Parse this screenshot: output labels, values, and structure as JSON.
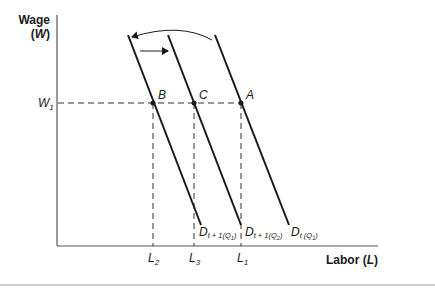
{
  "diagram": {
    "y_axis": {
      "label_line1": "Wage",
      "label_line2": "(W)"
    },
    "x_axis": {
      "label": "Labor (L)"
    },
    "wage_level": {
      "label": "W",
      "subscript": "1"
    },
    "points": [
      {
        "id": "B",
        "label": "B"
      },
      {
        "id": "C",
        "label": "C"
      },
      {
        "id": "A",
        "label": "A"
      }
    ],
    "labor_ticks": [
      {
        "label": "L",
        "subscript": "2"
      },
      {
        "label": "L",
        "subscript": "3"
      },
      {
        "label": "L",
        "subscript": "1"
      }
    ],
    "curves": [
      {
        "main": "D",
        "sub1": "t + 1(Q",
        "sub2": "1",
        "sub3": ")"
      },
      {
        "main": "D",
        "sub1": "t + 1(Q",
        "sub2": "2",
        "sub3": ")"
      },
      {
        "main": "D",
        "sub1": "t (Q",
        "sub2": "1",
        "sub3": ")"
      }
    ],
    "colors": {
      "line": "#1a1a1a",
      "axis": "#555555",
      "dash": "#333333"
    }
  }
}
